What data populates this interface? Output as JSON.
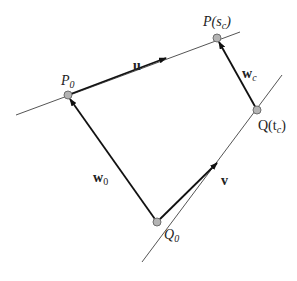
{
  "diagram": {
    "type": "closest-points-between-lines",
    "line_color": "#555555",
    "vector_color": "#111111",
    "point_fill": "#b4b4b4",
    "point_stroke": "#6e6e6e",
    "points": {
      "P0": {
        "label": "P",
        "sub": "0"
      },
      "Psc": {
        "label": "P(s",
        "sub": "c",
        "close": ")"
      },
      "Qtc": {
        "label": "Q(t",
        "sub": "c",
        "close": ")"
      },
      "Q0": {
        "label": "Q",
        "sub": "0"
      }
    },
    "vectors": {
      "u": {
        "label": "u"
      },
      "v": {
        "label": "v"
      },
      "w0": {
        "label": "w",
        "sub": "0"
      },
      "wc": {
        "label": "w",
        "sub": "c"
      }
    }
  }
}
